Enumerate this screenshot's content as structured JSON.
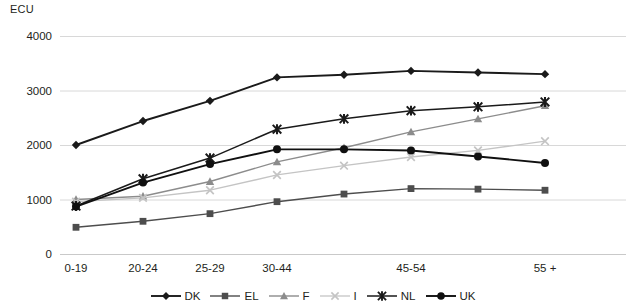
{
  "chart_data": {
    "type": "line",
    "title": "",
    "ylabel": "ECU",
    "xlabel": "",
    "ylim": [
      0,
      4000
    ],
    "yticks": [
      0,
      1000,
      2000,
      3000,
      4000
    ],
    "ytick_labels": [
      "0",
      "1000",
      "2000",
      "3000",
      "4000"
    ],
    "grid": true,
    "legend_position": "bottom",
    "x": [
      1,
      2,
      3,
      4,
      5,
      6,
      7,
      8
    ],
    "categories": [
      "0-19",
      "20-24",
      "25-29",
      "30-44",
      "",
      "45-54",
      "",
      "55 +"
    ],
    "xtick_labels": [
      "0-19",
      "20-24",
      "25-29",
      "30-44",
      "45-54",
      "55 +"
    ],
    "xtick_indices": [
      0,
      1,
      2,
      3,
      5,
      7
    ],
    "series": [
      {
        "name": "DK",
        "marker": "diamond",
        "color": "#1a1a1a",
        "width": 1.9,
        "values": [
          2000,
          2440,
          2810,
          3240,
          3290,
          3360,
          3330,
          3300
        ]
      },
      {
        "name": "EL",
        "marker": "square",
        "color": "#4d4d4d",
        "width": 1.4,
        "values": [
          490,
          600,
          740,
          960,
          1100,
          1200,
          1190,
          1170
        ]
      },
      {
        "name": "F",
        "marker": "triangle",
        "color": "#8c8c8c",
        "width": 1.4,
        "values": [
          1000,
          1060,
          1330,
          1690,
          1950,
          2240,
          2480,
          2720
        ]
      },
      {
        "name": "I",
        "marker": "x",
        "color": "#c4c4c4",
        "width": 1.3,
        "values": [
          960,
          1030,
          1170,
          1450,
          1620,
          1780,
          1900,
          2070
        ]
      },
      {
        "name": "NL",
        "marker": "star",
        "color": "#1a1a1a",
        "width": 1.5,
        "values": [
          880,
          1380,
          1760,
          2290,
          2480,
          2630,
          2700,
          2790
        ]
      },
      {
        "name": "UK",
        "marker": "circle",
        "color": "#101010",
        "width": 1.9,
        "values": [
          870,
          1310,
          1650,
          1920,
          1920,
          1900,
          1790,
          1670
        ]
      }
    ]
  }
}
